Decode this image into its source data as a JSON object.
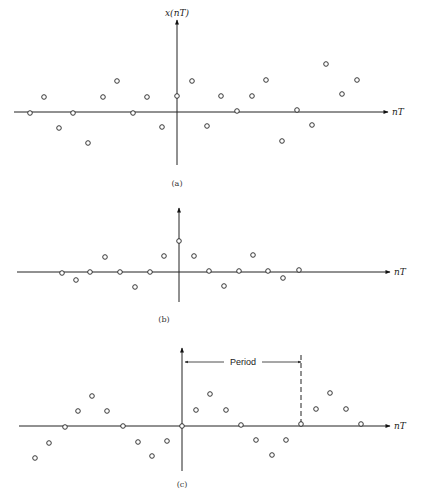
{
  "figure": {
    "panels": [
      {
        "id": "a",
        "caption": "(a)",
        "y_axis_label": "x(nT)",
        "x_axis_label": "nT",
        "axis_y": 112,
        "origin_x": 177,
        "vaxis_top": 20,
        "vaxis_bottom": 165,
        "haxis_left": 14,
        "haxis_right": 388,
        "caption_pos": [
          177,
          186
        ],
        "samples": [
          [
            30,
            113
          ],
          [
            44,
            97
          ],
          [
            59,
            128
          ],
          [
            73,
            113
          ],
          [
            88,
            143
          ],
          [
            103,
            97
          ],
          [
            117,
            81
          ],
          [
            133,
            113
          ],
          [
            147,
            97
          ],
          [
            162,
            127
          ],
          [
            177,
            96
          ],
          [
            192,
            81
          ],
          [
            207,
            126
          ],
          [
            221,
            96
          ],
          [
            237,
            111
          ],
          [
            252,
            96
          ],
          [
            266,
            80
          ],
          [
            282,
            141
          ],
          [
            297,
            110
          ],
          [
            312,
            125
          ],
          [
            326,
            64
          ],
          [
            342,
            94
          ],
          [
            357,
            80
          ]
        ]
      },
      {
        "id": "b",
        "caption": "(b)",
        "y_axis_label": "",
        "x_axis_label": "nT",
        "axis_y": 272,
        "origin_x": 179,
        "vaxis_top": 208,
        "vaxis_bottom": 302,
        "haxis_left": 17,
        "haxis_right": 390,
        "caption_pos": [
          164,
          322
        ],
        "samples": [
          [
            62,
            273
          ],
          [
            76,
            280
          ],
          [
            90,
            272
          ],
          [
            105,
            257
          ],
          [
            120,
            272
          ],
          [
            135,
            287
          ],
          [
            150,
            272
          ],
          [
            164,
            256
          ],
          [
            179,
            241
          ],
          [
            194,
            256
          ],
          [
            209,
            271
          ],
          [
            224,
            286
          ],
          [
            239,
            271
          ],
          [
            253,
            255
          ],
          [
            268,
            271
          ],
          [
            283,
            278
          ],
          [
            299,
            270
          ]
        ]
      },
      {
        "id": "c",
        "caption": "(c)",
        "y_axis_label": "",
        "x_axis_label": "nT",
        "axis_y": 426,
        "origin_x": 182,
        "vaxis_top": 348,
        "vaxis_bottom": 471,
        "haxis_left": 19,
        "haxis_right": 390,
        "caption_pos": [
          182,
          487
        ],
        "period_label": "Period",
        "period_start_x": 185,
        "period_end_x": 301,
        "period_y": 362,
        "samples": [
          [
            35,
            458
          ],
          [
            49,
            443
          ],
          [
            65,
            427
          ],
          [
            78,
            411
          ],
          [
            92,
            396
          ],
          [
            107,
            411
          ],
          [
            123,
            426
          ],
          [
            138,
            442
          ],
          [
            152,
            456
          ],
          [
            167,
            441
          ],
          [
            182,
            426
          ],
          [
            196,
            410
          ],
          [
            210,
            394
          ],
          [
            226,
            410
          ],
          [
            241,
            425
          ],
          [
            256,
            440
          ],
          [
            272,
            455
          ],
          [
            286,
            440
          ],
          [
            301,
            424
          ],
          [
            316,
            409
          ],
          [
            330,
            393
          ],
          [
            346,
            409
          ],
          [
            361,
            424
          ]
        ]
      }
    ]
  }
}
